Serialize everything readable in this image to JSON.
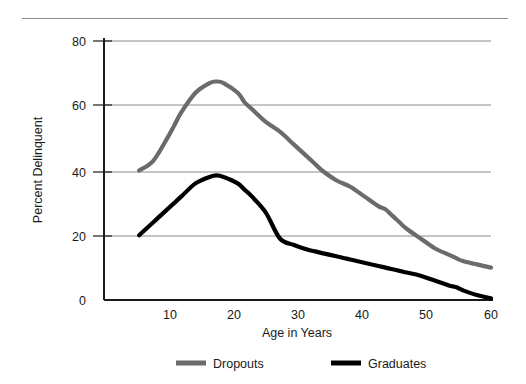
{
  "chart_data": {
    "type": "line",
    "title": "",
    "xlabel": "Age in Years",
    "ylabel": "Percent Delinquent",
    "xlim": [
      5,
      60
    ],
    "ylim": [
      0,
      80
    ],
    "xticks": [
      10,
      20,
      30,
      40,
      50,
      60
    ],
    "xtick_labels": [
      "10",
      "20",
      "30",
      "40",
      "50",
      "60"
    ],
    "yticks": [
      0,
      20,
      40,
      60,
      80
    ],
    "ytick_labels": [
      "0",
      "20",
      "40",
      "60",
      "80"
    ],
    "grid": "horizontal",
    "legend_position": "bottom",
    "x": [
      10,
      12,
      14,
      15,
      16,
      18,
      20,
      21,
      22,
      24,
      25,
      26,
      28,
      30,
      32,
      34,
      35,
      36,
      38,
      40,
      42,
      44,
      45,
      46,
      47,
      48,
      50,
      52,
      54,
      55,
      56,
      58,
      60
    ],
    "series": [
      {
        "name": "Dropouts",
        "color": "#6b6b6b",
        "values": [
          40,
          43,
          50,
          54,
          58,
          64,
          67,
          67.5,
          67,
          64,
          61,
          59,
          55,
          52,
          48,
          44,
          42,
          40,
          37,
          35,
          32,
          29,
          28,
          26,
          24,
          22,
          19,
          16,
          14,
          13,
          12,
          11,
          10
        ]
      },
      {
        "name": "Graduates",
        "color": "#000000",
        "values": [
          20,
          24,
          28,
          30,
          32,
          36,
          38,
          38.5,
          38,
          36,
          34,
          32,
          27,
          19,
          17,
          15.5,
          15,
          14.5,
          13.5,
          12.5,
          11.5,
          10.5,
          10,
          9.5,
          9,
          8.5,
          7.5,
          6,
          4.5,
          4,
          3,
          1.5,
          0.5
        ]
      }
    ],
    "annotations": []
  },
  "legend": {
    "items": [
      {
        "label": "Dropouts",
        "color": "#6b6b6b"
      },
      {
        "label": "Graduates",
        "color": "#000000"
      }
    ]
  },
  "axes": {
    "x_title": "Age in Years",
    "y_title": "Percent Delinquent",
    "x_tick_0": "10",
    "x_tick_1": "20",
    "x_tick_2": "30",
    "x_tick_3": "40",
    "x_tick_4": "50",
    "x_tick_5": "60",
    "y_tick_0": "0",
    "y_tick_1": "20",
    "y_tick_2": "40",
    "y_tick_3": "60",
    "y_tick_4": "80"
  },
  "colors": {
    "dropouts": "#6b6b6b",
    "graduates": "#000000",
    "grid": "#8a8a8a",
    "axis": "#1a1a1a",
    "rule": "#8a8a8a",
    "background": "#ffffff"
  }
}
